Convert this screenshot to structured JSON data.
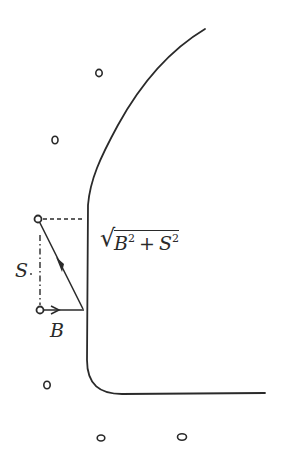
{
  "diagram": {
    "type": "vector-decomposition",
    "labels": {
      "s_label": "S",
      "b_label": "B",
      "resultant": {
        "b_var": "B",
        "b_exp": "2",
        "plus": "+",
        "s_var": "S",
        "s_exp": "2"
      }
    },
    "colors": {
      "ink": "#2a2a2a",
      "background": "#ffffff"
    },
    "points": [
      {
        "x": 99,
        "y": 73
      },
      {
        "x": 55,
        "y": 140
      },
      {
        "x": 46,
        "y": 385
      },
      {
        "x": 101,
        "y": 437
      },
      {
        "x": 182,
        "y": 437
      }
    ],
    "vector_points": {
      "upper": {
        "x": 38,
        "y": 219
      },
      "lower": {
        "x": 40,
        "y": 310
      },
      "foot": {
        "x": 83,
        "y": 310
      }
    }
  }
}
